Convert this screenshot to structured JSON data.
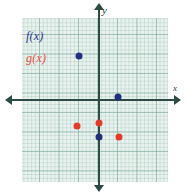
{
  "chart_data": {
    "type": "scatter",
    "title": "",
    "xlabel": "x",
    "ylabel": "y",
    "xlim": [
      -4,
      3.5
    ],
    "ylim": [
      -4,
      4
    ],
    "grid": true,
    "grid_minor": true,
    "legend_position": "top-left",
    "axis_labels": {
      "x": "x",
      "y": "y"
    },
    "series": [
      {
        "name": "f(x)",
        "color": "#21307e",
        "marker": "circle",
        "points": [
          {
            "x": -1,
            "y": 2.25
          },
          {
            "x": 1,
            "y": 0.15
          },
          {
            "x": 0,
            "y": -1.9
          }
        ]
      },
      {
        "name": "g(x)",
        "color": "#e23b2a",
        "marker": "circle",
        "points": [
          {
            "x": 0,
            "y": -1.15
          },
          {
            "x": -1.1,
            "y": -1.3
          },
          {
            "x": 1.05,
            "y": -1.9
          }
        ]
      }
    ]
  },
  "legend": {
    "f_label": "f(x)",
    "g_label": "g(x)",
    "f_color": "#2a3990",
    "g_color": "#e8503c"
  },
  "axes": {
    "x_label": "x",
    "y_label": "y",
    "axis_color": "#2d4a44"
  },
  "plot": {
    "background_color": "#e9f2ee",
    "gridline_color": "#78a596"
  }
}
